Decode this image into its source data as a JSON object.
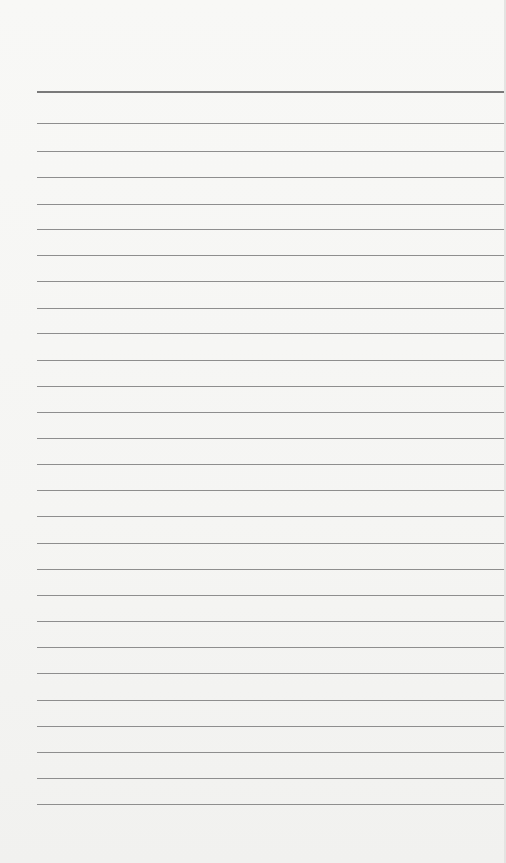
{
  "page": {
    "type": "lined-paper",
    "background": "#f6f6f4",
    "line_color": "#8e8e8e",
    "line_left_margin": 37,
    "line_count": 28,
    "line_positions_y": [
      91,
      123,
      151,
      177,
      204,
      229,
      255,
      281,
      308,
      333,
      360,
      386,
      412,
      438,
      464,
      490,
      516,
      543,
      569,
      595,
      621,
      647,
      673,
      700,
      726,
      752,
      778,
      804
    ]
  }
}
